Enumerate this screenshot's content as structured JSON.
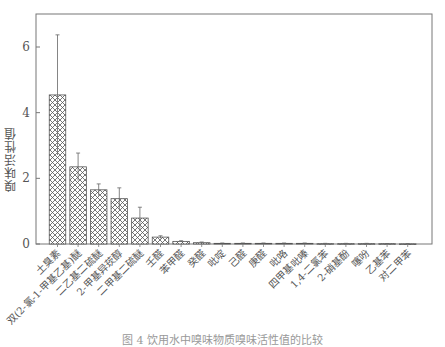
{
  "chart_data": {
    "type": "bar",
    "title": "",
    "xlabel": "",
    "ylabel": "嗅味活性值",
    "ylim": [
      0,
      7
    ],
    "yticks": [
      0,
      2,
      4,
      6
    ],
    "grid": false,
    "legend": null,
    "bar_pattern": "crosshatch",
    "categories": [
      "土臭素",
      "双(2-氯-1-甲基乙基)醚",
      "二乙基二硫醚",
      "2-甲基异莰醇",
      "二甲基二硫醚",
      "壬醛",
      "苯甲醛",
      "癸醛",
      "吡啶",
      "己醛",
      "庚醛",
      "吡咯",
      "四甲基吡嗪",
      "1,4-二氯苯",
      "2-硝基酚",
      "噻吩",
      "乙基苯",
      "对二甲苯"
    ],
    "values": [
      4.54,
      2.35,
      1.65,
      1.38,
      0.79,
      0.21,
      0.08,
      0.04,
      0.02,
      0.02,
      0.02,
      0.02,
      0.02,
      0.01,
      0.01,
      0.01,
      0.01,
      0.005
    ],
    "errors": [
      1.83,
      0.42,
      0.18,
      0.33,
      0.33,
      0.04,
      0.02,
      0.02,
      0.01,
      0.01,
      0.01,
      0.01,
      0.01,
      0.01,
      0.01,
      0.01,
      0.005,
      0.005
    ]
  },
  "caption": "图 4   饮用水中嗅味物质嗅味活性值的比较"
}
